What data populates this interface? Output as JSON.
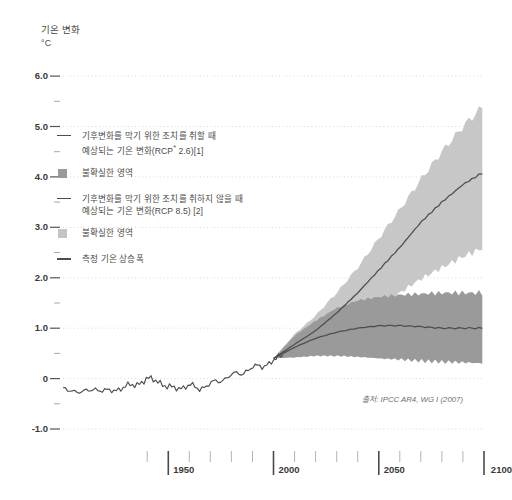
{
  "yaxis": {
    "title": "기온 변화",
    "unit": "°C",
    "ticks": [
      "6.0",
      "5.0",
      "4.0",
      "3.0",
      "2.0",
      "1.0",
      "0",
      "-1.0"
    ]
  },
  "xaxis": {
    "ticks": [
      "1950",
      "2000",
      "2050",
      "2100"
    ]
  },
  "legend": {
    "items": [
      {
        "marker": "line",
        "color": "#4d4d4d",
        "line1": "기후변화를 막기 위한 조치를 취할 때",
        "line2_pre": "예상되는 기온 변화(RCP",
        "line2_sup": "*",
        "line2_post": " 2.6)[1]"
      },
      {
        "marker": "swatch",
        "color": "#9a9a9a",
        "line1": "불확실한 영역"
      },
      {
        "marker": "line",
        "color": "#4d4d4d",
        "line1": "기후변화를 막기 위한 조치를 취하지 않을 때",
        "line2_pre": "예상되는 기온 변화(RCP 8.5) [2]"
      },
      {
        "marker": "swatch",
        "color": "#c4c4c4",
        "line1": "불확실한 영역"
      },
      {
        "marker": "line",
        "color": "#4d4d4d",
        "line1": "측정 기온 상승폭"
      }
    ]
  },
  "source": "출처: IPCC AR4, WG I (2007)",
  "colors": {
    "band_rcp26": "#9a9a9a",
    "band_rcp85": "#c7c7c7",
    "line": "#4d4d4d",
    "grid": "#d8d8d8",
    "axis": "#555555"
  },
  "chart_data": {
    "type": "area",
    "title": "기온 변화",
    "xlabel": "",
    "ylabel": "기온 변화 (°C)",
    "xlim": [
      1900,
      2100
    ],
    "ylim": [
      -1.0,
      6.2
    ],
    "grid": true,
    "legend_position": "inside-upper-left",
    "yticks": [
      -1.0,
      0,
      1.0,
      2.0,
      3.0,
      4.0,
      5.0,
      6.0
    ],
    "xticks": [
      1950,
      2000,
      2050,
      2100
    ],
    "xminor_step": 10,
    "yminor_step": 0.5,
    "series": [
      {
        "name": "측정 기온 상승폭",
        "type": "line",
        "x": [
          1900,
          1905,
          1910,
          1915,
          1920,
          1925,
          1930,
          1935,
          1940,
          1945,
          1950,
          1955,
          1960,
          1965,
          1970,
          1975,
          1980,
          1985,
          1990,
          1995,
          2000,
          2005
        ],
        "values": [
          -0.22,
          -0.24,
          -0.27,
          -0.2,
          -0.25,
          -0.23,
          -0.15,
          -0.12,
          0.0,
          -0.05,
          -0.17,
          -0.2,
          -0.12,
          -0.22,
          -0.08,
          -0.06,
          0.1,
          0.08,
          0.25,
          0.22,
          0.38,
          0.45
        ]
      },
      {
        "name": "예상되는 기온 변화(RCP 2.6)",
        "type": "line",
        "x": [
          2000,
          2010,
          2020,
          2030,
          2040,
          2050,
          2060,
          2070,
          2080,
          2090,
          2100
        ],
        "values": [
          0.4,
          0.62,
          0.8,
          0.92,
          1.0,
          1.05,
          1.05,
          1.03,
          1.0,
          1.0,
          1.0
        ],
        "band_name": "불확실한 영역",
        "band_lower": [
          0.4,
          0.42,
          0.45,
          0.45,
          0.43,
          0.4,
          0.38,
          0.35,
          0.33,
          0.32,
          0.3
        ],
        "band_upper": [
          0.4,
          0.85,
          1.15,
          1.4,
          1.55,
          1.62,
          1.66,
          1.68,
          1.7,
          1.7,
          1.7
        ]
      },
      {
        "name": "예상되는 기온 변화(RCP 8.5)",
        "type": "line",
        "x": [
          2000,
          2010,
          2020,
          2030,
          2040,
          2050,
          2060,
          2070,
          2080,
          2090,
          2100
        ],
        "values": [
          0.4,
          0.68,
          0.95,
          1.3,
          1.7,
          2.15,
          2.6,
          3.1,
          3.5,
          3.85,
          4.1
        ],
        "band_name": "불확실한 영역",
        "band_lower": [
          0.4,
          0.5,
          0.68,
          0.9,
          1.15,
          1.45,
          1.7,
          1.98,
          2.2,
          2.42,
          2.6
        ],
        "band_upper": [
          0.4,
          0.88,
          1.25,
          1.7,
          2.2,
          2.78,
          3.35,
          3.95,
          4.5,
          5.0,
          5.42
        ]
      }
    ]
  }
}
